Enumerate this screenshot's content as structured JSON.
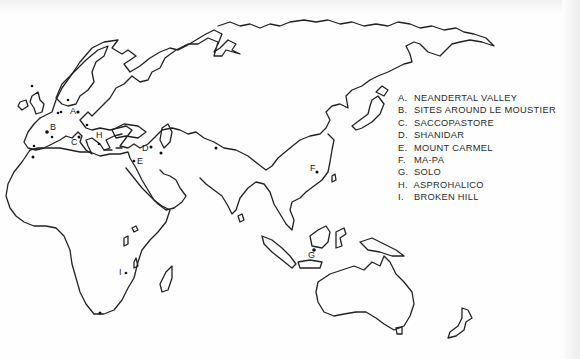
{
  "map": {
    "title": "Neandertal and related fossil sites",
    "colors": {
      "coast": "#222222",
      "marker": "#111111",
      "text": "#2a2a2a",
      "background": "#fefefe"
    },
    "legend": [
      {
        "key": "A.",
        "label": "NEANDERTAL VALLEY"
      },
      {
        "key": "B.",
        "label": "SITES AROUND LE MOUSTIER"
      },
      {
        "key": "C.",
        "label": "SACCOPASTORE"
      },
      {
        "key": "D.",
        "label": "SHANIDAR"
      },
      {
        "key": "E.",
        "label": "MOUNT CARMEL"
      },
      {
        "key": "F.",
        "label": "MA-PA"
      },
      {
        "key": "G.",
        "label": "SOLO"
      },
      {
        "key": "H.",
        "label": "ASPROHALICO"
      },
      {
        "key": "I.",
        "label": "BROKEN HILL"
      }
    ],
    "site_labels": {
      "A": "A",
      "B": "B",
      "C": "C",
      "D": "D",
      "E": "E",
      "F": "F",
      "G": "G",
      "H": "H",
      "I": "I"
    }
  }
}
